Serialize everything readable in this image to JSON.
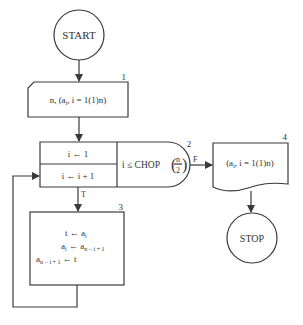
{
  "diagram": {
    "type": "flowchart",
    "nodes": {
      "start": {
        "label": "START"
      },
      "input": {
        "number": "1",
        "text": "n, (a",
        "sub": "i",
        "rest": ", i = 1(1)n)"
      },
      "loop": {
        "number": "2",
        "init": "i ← 1",
        "incr": "i ← i + 1",
        "cond_prefix": "i ≤ CHOP",
        "cond_num": "n",
        "cond_den": "2",
        "false_label": "F",
        "true_label": "T"
      },
      "swap": {
        "number": "3",
        "line1_lhs": "t ← a",
        "line1_sub": "i",
        "line2_lhs": "a",
        "line2_sub1": "i",
        "line2_mid": " ← a",
        "line2_sub2": "n − i + 1",
        "line3_lhs": "a",
        "line3_sub": "n − i + 1",
        "line3_rest": " ← t"
      },
      "output": {
        "number": "4",
        "text": "(a",
        "sub": "i",
        "rest": ", i = 1(1)n)"
      },
      "stop": {
        "label": "STOP"
      }
    }
  }
}
